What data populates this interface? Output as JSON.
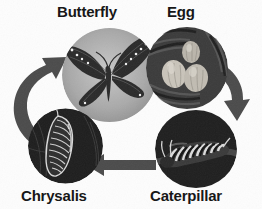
{
  "diagram": {
    "background_color": "#fdfdfd",
    "arrow_color": "#494949",
    "label_color": "#131313",
    "direction": "clockwise",
    "stages": [
      {
        "id": "butterfly",
        "label": "Butterfly",
        "position": "top-left",
        "image": "butterfly-photo",
        "image_description": "monarch butterfly with spread wings on light gray circular background",
        "circle_background": "#a8a8a8"
      },
      {
        "id": "egg",
        "label": "Egg",
        "position": "top-right",
        "image": "egg-photo",
        "image_description": "three pale oval eggs on a dark textured leaf",
        "circle_background": "#3a3a3a"
      },
      {
        "id": "caterpillar",
        "label": "Caterpillar",
        "position": "bottom-right",
        "image": "caterpillar-photo",
        "image_description": "striped caterpillar on a twig against a dark background",
        "circle_background": "#222222"
      },
      {
        "id": "chrysalis",
        "label": "Chrysalis",
        "position": "bottom-left",
        "image": "chrysalis-photo",
        "image_description": "ridged chrysalis pupa hanging against a dark background",
        "circle_background": "#1d1d1d"
      }
    ],
    "arrows": [
      {
        "id": "arrow-butterfly-to-egg",
        "from": "butterfly",
        "to": "egg",
        "shape": "straight-horizontal",
        "points": "right"
      },
      {
        "id": "arrow-egg-to-caterpillar",
        "from": "egg",
        "to": "caterpillar",
        "shape": "curved",
        "points": "down-right"
      },
      {
        "id": "arrow-caterpillar-to-chrysalis",
        "from": "caterpillar",
        "to": "chrysalis",
        "shape": "straight-horizontal",
        "points": "left"
      },
      {
        "id": "arrow-chrysalis-to-butterfly",
        "from": "chrysalis",
        "to": "butterfly",
        "shape": "curved",
        "points": "up-right"
      }
    ]
  }
}
